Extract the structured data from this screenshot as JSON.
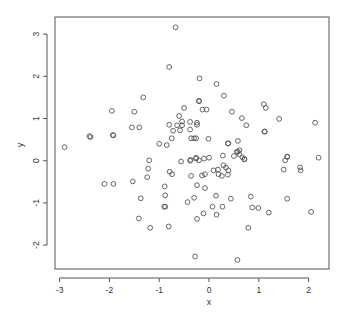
{
  "chart_data": {
    "type": "scatter",
    "title": "",
    "xlabel": "x",
    "ylabel": "y",
    "xlim": [
      -3.1,
      2.4
    ],
    "ylim": [
      -2.6,
      3.4
    ],
    "x_ticks": [
      -3,
      -2,
      -1,
      0,
      1,
      2
    ],
    "y_ticks": [
      -2,
      -1,
      0,
      1,
      2,
      3
    ],
    "x_tick_labels": [
      "-3",
      "-2",
      "-1",
      "0",
      "1",
      "2"
    ],
    "y_tick_labels": [
      "-2",
      "-1",
      "0",
      "1",
      "2",
      "3"
    ],
    "grid": false,
    "legend": null,
    "marker": "open-circle",
    "marker_color": "#555555",
    "points": [
      {
        "x": -0.67,
        "y": 3.16
      },
      {
        "x": -0.8,
        "y": 2.22
      },
      {
        "x": -0.19,
        "y": 1.95
      },
      {
        "x": 0.15,
        "y": 1.82
      },
      {
        "x": 0.3,
        "y": 1.54
      },
      {
        "x": -1.32,
        "y": 1.5
      },
      {
        "x": -0.2,
        "y": 1.41
      },
      {
        "x": -1.95,
        "y": 1.18
      },
      {
        "x": -1.5,
        "y": 1.16
      },
      {
        "x": -0.5,
        "y": 1.25
      },
      {
        "x": -0.6,
        "y": 1.06
      },
      {
        "x": -1.92,
        "y": 0.6
      },
      {
        "x": -1.55,
        "y": 0.79
      },
      {
        "x": -1.4,
        "y": 0.79
      },
      {
        "x": -0.54,
        "y": 0.93
      },
      {
        "x": -0.54,
        "y": 0.84
      },
      {
        "x": -0.64,
        "y": 0.84
      },
      {
        "x": -0.38,
        "y": 0.92
      },
      {
        "x": -0.24,
        "y": 0.9
      },
      {
        "x": -0.38,
        "y": 0.74
      },
      {
        "x": -0.58,
        "y": 0.72
      },
      {
        "x": -0.8,
        "y": 0.85
      },
      {
        "x": -0.2,
        "y": 1.42
      },
      {
        "x": -0.13,
        "y": 1.21
      },
      {
        "x": -0.05,
        "y": 1.21
      },
      {
        "x": 0.46,
        "y": 1.16
      },
      {
        "x": 0.66,
        "y": 1.01
      },
      {
        "x": 0.75,
        "y": 0.84
      },
      {
        "x": -0.24,
        "y": 0.85
      },
      {
        "x": 1.1,
        "y": 1.34
      },
      {
        "x": 1.14,
        "y": 1.25
      },
      {
        "x": 1.41,
        "y": 0.99
      },
      {
        "x": 2.13,
        "y": 0.9
      },
      {
        "x": 1.12,
        "y": 0.69
      },
      {
        "x": 1.11,
        "y": 0.69
      },
      {
        "x": -2.38,
        "y": 0.56
      },
      {
        "x": -2.4,
        "y": 0.58
      },
      {
        "x": -1.93,
        "y": 0.61
      },
      {
        "x": -2.9,
        "y": 0.32
      },
      {
        "x": -0.75,
        "y": 0.53
      },
      {
        "x": -0.85,
        "y": 0.37
      },
      {
        "x": -0.36,
        "y": 0.53
      },
      {
        "x": -0.26,
        "y": 0.53
      },
      {
        "x": -0.3,
        "y": 0.53
      },
      {
        "x": -0.72,
        "y": 0.71
      },
      {
        "x": -1.0,
        "y": 0.4
      },
      {
        "x": -0.26,
        "y": 0.07
      },
      {
        "x": -0.37,
        "y": 0.02
      },
      {
        "x": -0.38,
        "y": 0.0
      },
      {
        "x": -0.56,
        "y": -0.02
      },
      {
        "x": -1.2,
        "y": 0.01
      },
      {
        "x": -0.2,
        "y": 0.01
      },
      {
        "x": 0.39,
        "y": 0.41
      },
      {
        "x": 0.61,
        "y": 0.25
      },
      {
        "x": 0.58,
        "y": 0.21
      },
      {
        "x": 0.67,
        "y": 0.08
      },
      {
        "x": 0.39,
        "y": -0.23
      },
      {
        "x": 0.56,
        "y": 0.21
      },
      {
        "x": 0.71,
        "y": 0.04
      },
      {
        "x": -0.01,
        "y": 0.52
      },
      {
        "x": -0.26,
        "y": 0.05
      },
      {
        "x": 0.58,
        "y": 0.47
      },
      {
        "x": 0.38,
        "y": 0.41
      },
      {
        "x": 0.5,
        "y": 0.11
      },
      {
        "x": 0.0,
        "y": 0.07
      },
      {
        "x": -0.1,
        "y": 0.05
      },
      {
        "x": 0.28,
        "y": 0.12
      },
      {
        "x": 0.71,
        "y": 0.03
      },
      {
        "x": 0.61,
        "y": 0.15
      },
      {
        "x": 1.57,
        "y": 0.09
      },
      {
        "x": 1.53,
        "y": 0.01
      },
      {
        "x": 1.57,
        "y": 0.1
      },
      {
        "x": 2.2,
        "y": 0.07
      },
      {
        "x": 1.84,
        "y": -0.23
      },
      {
        "x": 1.5,
        "y": -0.21
      },
      {
        "x": 1.83,
        "y": -0.16
      },
      {
        "x": -1.53,
        "y": -0.49
      },
      {
        "x": -1.92,
        "y": -0.55
      },
      {
        "x": -2.1,
        "y": -0.55
      },
      {
        "x": -1.37,
        "y": -0.89
      },
      {
        "x": -0.89,
        "y": -0.61
      },
      {
        "x": -0.74,
        "y": -0.32
      },
      {
        "x": -1.24,
        "y": -0.39
      },
      {
        "x": -0.79,
        "y": -0.26
      },
      {
        "x": -1.22,
        "y": -0.19
      },
      {
        "x": -0.36,
        "y": -0.36
      },
      {
        "x": -0.24,
        "y": -0.58
      },
      {
        "x": -0.3,
        "y": -0.88
      },
      {
        "x": -0.9,
        "y": -1.09
      },
      {
        "x": -0.88,
        "y": -0.82
      },
      {
        "x": -0.43,
        "y": -0.98
      },
      {
        "x": -0.88,
        "y": -1.09
      },
      {
        "x": -1.41,
        "y": -1.37
      },
      {
        "x": -1.18,
        "y": -1.59
      },
      {
        "x": -0.81,
        "y": -1.56
      },
      {
        "x": -0.24,
        "y": -1.38
      },
      {
        "x": -0.14,
        "y": -0.35
      },
      {
        "x": 0.09,
        "y": -0.23
      },
      {
        "x": 0.18,
        "y": -0.21
      },
      {
        "x": 0.19,
        "y": -0.32
      },
      {
        "x": 0.26,
        "y": -0.36
      },
      {
        "x": 0.38,
        "y": -0.33
      },
      {
        "x": 0.29,
        "y": -0.11
      },
      {
        "x": -0.08,
        "y": -0.32
      },
      {
        "x": 0.34,
        "y": -0.16
      },
      {
        "x": -0.08,
        "y": -0.65
      },
      {
        "x": 0.14,
        "y": -0.83
      },
      {
        "x": 0.44,
        "y": -0.9
      },
      {
        "x": 0.07,
        "y": -1.09
      },
      {
        "x": 0.27,
        "y": -1.09
      },
      {
        "x": 0.87,
        "y": -1.11
      },
      {
        "x": 0.99,
        "y": -1.12
      },
      {
        "x": 1.57,
        "y": -0.9
      },
      {
        "x": 0.84,
        "y": -0.85
      },
      {
        "x": 1.2,
        "y": -1.23
      },
      {
        "x": 2.05,
        "y": -1.21
      },
      {
        "x": -0.11,
        "y": -1.25
      },
      {
        "x": 0.15,
        "y": -1.28
      },
      {
        "x": 0.79,
        "y": -1.59
      },
      {
        "x": -0.28,
        "y": -2.27
      },
      {
        "x": 0.57,
        "y": -2.35
      }
    ]
  },
  "labels": {
    "xlabel": "x",
    "ylabel": "y"
  },
  "style": {
    "axis_color": "#555555",
    "marker_color": "#555555",
    "background": "#ffffff"
  }
}
